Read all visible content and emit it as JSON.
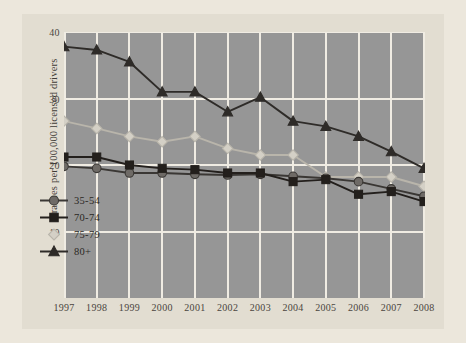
{
  "chart_data": {
    "type": "line",
    "title": "",
    "xlabel": "",
    "ylabel": "Crashes per 100,000 licensed drivers",
    "categories": [
      "1997",
      "1998",
      "1999",
      "2000",
      "2001",
      "2002",
      "2003",
      "2004",
      "2005",
      "2006",
      "2007",
      "2008"
    ],
    "x": [
      1997,
      1998,
      1999,
      2000,
      2001,
      2002,
      2003,
      2004,
      2005,
      2006,
      2007,
      2008
    ],
    "ylim": [
      0,
      40
    ],
    "yticks": [
      10,
      20,
      30,
      40
    ],
    "xlim": [
      1997,
      2008
    ],
    "grid": "vertical-and-horizontal",
    "legend_position": "inside-lower-left",
    "background_color": "#969696",
    "gridline_color": "#f0ece3",
    "page_color": "#e2ddd1",
    "series": [
      {
        "name": "35-54",
        "marker": "circle",
        "color": "#6e6a66",
        "line_color": "#3a3734",
        "values": [
          19.8,
          19.5,
          18.8,
          18.8,
          18.6,
          18.5,
          18.6,
          18.3,
          18.0,
          17.5,
          16.4,
          15.3
        ]
      },
      {
        "name": "70-74",
        "marker": "square",
        "color": "#231f1c",
        "line_color": "#231f1c",
        "values": [
          21.2,
          21.2,
          20.0,
          19.5,
          19.3,
          18.8,
          18.8,
          17.5,
          17.8,
          15.6,
          16.0,
          14.5
        ]
      },
      {
        "name": "75-79",
        "marker": "diamond",
        "color": "#d4d0c6",
        "line_color": "#b9b5ab",
        "values": [
          26.6,
          25.5,
          24.3,
          23.5,
          24.3,
          22.5,
          21.5,
          21.5,
          18.2,
          18.2,
          18.2,
          16.8
        ]
      },
      {
        "name": "80+",
        "marker": "triangle",
        "color": "#2e2b28",
        "line_color": "#2e2b28",
        "values": [
          37.8,
          37.3,
          35.5,
          31.0,
          31.0,
          28.0,
          30.2,
          26.6,
          25.8,
          24.3,
          22.0,
          19.5
        ]
      }
    ]
  }
}
